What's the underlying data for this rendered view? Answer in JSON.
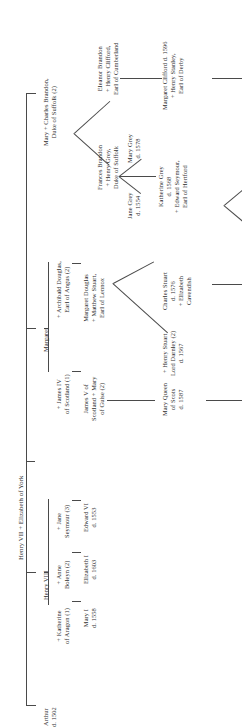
{
  "diagram": {
    "type": "genealogy-tree",
    "title": "Henry VII + Elizabeth of York",
    "orientation": "rotated-90-ccw",
    "line_color": "#4a4a4a",
    "text_color": "#303030",
    "background": "#ffffff"
  },
  "nodes": {
    "root": {
      "lines": [
        "Henry VII + Elizabeth of York"
      ]
    },
    "arthur": {
      "lines": [
        "Arthur",
        "d. 1502"
      ]
    },
    "henry8": {
      "lines": [
        "Henry VIII"
      ]
    },
    "katherine_aragon": {
      "lines": [
        "+ Katherine",
        "of Aragon (1)"
      ]
    },
    "anne_boleyn": {
      "lines": [
        "+ Anne",
        "Boleyn (2)"
      ]
    },
    "jane_seymour": {
      "lines": [
        "+ Jane",
        "Seymour (3)"
      ]
    },
    "mary1": {
      "lines": [
        "Mary I",
        "d. 1558"
      ]
    },
    "elizabeth1": {
      "lines": [
        "Elizabeth I",
        "d. 1603"
      ]
    },
    "edward6": {
      "lines": [
        "Edward VI",
        "d. 1553"
      ]
    },
    "margaret": {
      "lines": [
        "Margaret"
      ]
    },
    "james4": {
      "lines": [
        "+ James IV",
        "of Scotland (1)"
      ]
    },
    "archibald_douglas": {
      "lines": [
        "+ Archibald Douglas,",
        "Earl of Angus (2)"
      ]
    },
    "james5": {
      "lines": [
        "James V of",
        "Scotland + Mary",
        "of Guise (2)"
      ]
    },
    "margaret_douglas": {
      "lines": [
        "Margaret Douglas",
        "+ Matthew Stuart,",
        "Earl of Lennox"
      ]
    },
    "mary_queen_scots": {
      "lines": [
        "Mary Queen",
        "of Scots",
        "d. 1587"
      ]
    },
    "henry_darnley": {
      "lines": [
        "+  Henry Stuart",
        "Lord Darnley (2)",
        "d. 1567"
      ]
    },
    "charles_stuart": {
      "lines": [
        "Charles Stuart",
        "d. 1576",
        "+ Elizabeth",
        "Cavendish"
      ]
    },
    "mary_brandon": {
      "lines": [
        "Mary + Charles Brandon,",
        "Duke of Suffolk (2)"
      ]
    },
    "frances_brandon": {
      "lines": [
        "Frances Brandon",
        "+ Henry Grey,",
        "Duke of Suffolk"
      ]
    },
    "eleanor_brandon": {
      "lines": [
        "Eleanor Brandon",
        "+ Henry Clifford,",
        "Earl of Cumberland"
      ]
    },
    "jane_grey": {
      "lines": [
        "Jane Grey",
        "d. 1554"
      ]
    },
    "katherine_grey": {
      "lines": [
        "Katherine Grey",
        "d. 1568",
        "+ Edward Seymour,",
        "Earl of Hertford"
      ]
    },
    "mary_grey": {
      "lines": [
        "Mary Grey",
        "d. 1578"
      ]
    },
    "margaret_clifford": {
      "lines": [
        "Margaret Clifford d. 1596",
        "+ Henry Stanley,",
        "Earl of Derby"
      ]
    }
  }
}
